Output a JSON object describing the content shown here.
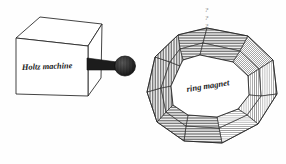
{
  "figure": {
    "background_color": "#fefefe",
    "ink_color": "#222222",
    "labels": {
      "machine": "Holtz machine",
      "ring": "ring magnet"
    },
    "marks_above_ring": {
      "glyph": "?",
      "count": 3,
      "description": "faint-annotation-marks"
    },
    "objects": [
      {
        "name": "holtz-machine-box",
        "label": "Holtz machine",
        "shape": "cuboid",
        "face_fill": "#ffffff"
      },
      {
        "name": "crank-rod",
        "label": "",
        "shape": "rod",
        "face_fill": "#1c1c1c"
      },
      {
        "name": "crank-knob",
        "label": "",
        "shape": "sphere",
        "face_fill": "#2b2b2b"
      },
      {
        "name": "ring-magnet",
        "label": "ring magnet",
        "shape": "polygonal-torus",
        "segment_count": 10,
        "face_fill": "#ffffff"
      }
    ],
    "ring_segments": [
      {
        "index": 0,
        "shade": "#8f8f8f",
        "hatch": "vertical"
      },
      {
        "index": 1,
        "shade": "#9a9a9a",
        "hatch": "horizontal"
      },
      {
        "index": 2,
        "shade": "#858585",
        "hatch": "horizontal"
      },
      {
        "index": 3,
        "shade": "#b4b4b4",
        "hatch": "diagonal"
      },
      {
        "index": 4,
        "shade": "#c8c8c8",
        "hatch": "vertical"
      },
      {
        "index": 5,
        "shade": "#d2d2d2",
        "hatch": "vertical"
      },
      {
        "index": 6,
        "shade": "#a8a8a8",
        "hatch": "horizontal"
      },
      {
        "index": 7,
        "shade": "#9c9c9c",
        "hatch": "horizontal"
      },
      {
        "index": 8,
        "shade": "#8a8a8a",
        "hatch": "vertical"
      },
      {
        "index": 9,
        "shade": "#7f7f7f",
        "hatch": "vertical"
      }
    ]
  }
}
